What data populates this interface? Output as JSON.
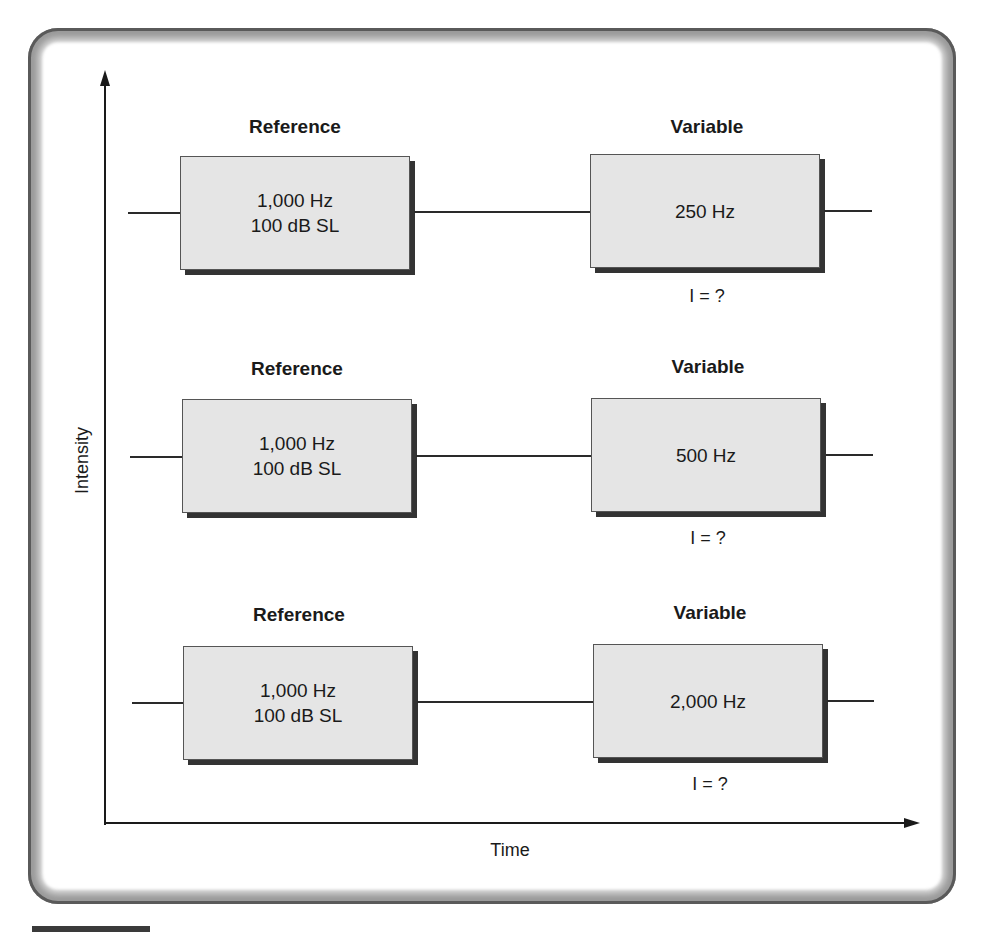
{
  "axes": {
    "y_label": "Intensity",
    "x_label": "Time"
  },
  "rows": [
    {
      "reference": {
        "heading": "Reference",
        "line1": "1,000 Hz",
        "line2": "100 dB SL"
      },
      "variable": {
        "heading": "Variable",
        "freq": "250 Hz",
        "intensity": "I = ?"
      }
    },
    {
      "reference": {
        "heading": "Reference",
        "line1": "1,000 Hz",
        "line2": "100 dB SL"
      },
      "variable": {
        "heading": "Variable",
        "freq": "500 Hz",
        "intensity": "I = ?"
      }
    },
    {
      "reference": {
        "heading": "Reference",
        "line1": "1,000 Hz",
        "line2": "100 dB SL"
      },
      "variable": {
        "heading": "Variable",
        "freq": "2,000 Hz",
        "intensity": "I = ?"
      }
    }
  ],
  "colors": {
    "box_fill": "#e5e5e5",
    "box_shadow": "#333333",
    "text": "#1a1a1a"
  }
}
